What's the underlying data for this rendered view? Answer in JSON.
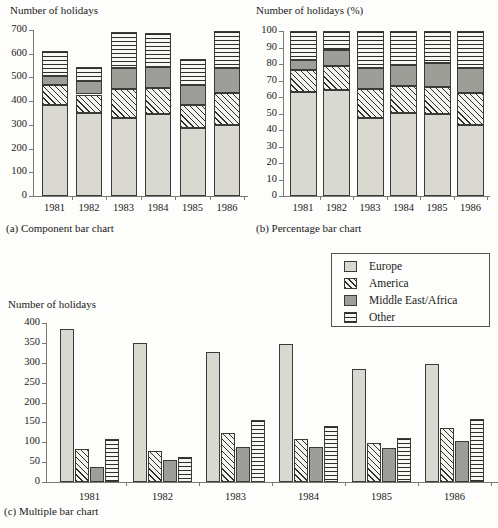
{
  "figure": {
    "panels": [
      {
        "caption": "(a) Component bar chart",
        "ylabel": "Number of holidays"
      },
      {
        "caption": "(b) Percentage bar chart",
        "ylabel": "Number of holidays (%)"
      },
      {
        "caption": "(c) Multiple bar chart",
        "ylabel": "Number of holidays"
      }
    ]
  },
  "legend": {
    "items": [
      {
        "label": "Europe",
        "swatch": "light-grey-solid-swatch",
        "color": "#d9d9d2"
      },
      {
        "label": "America",
        "swatch": "diagonal-hatch-swatch",
        "color": "#f4f4ef"
      },
      {
        "label": "Middle East/Africa",
        "swatch": "mid-grey-solid-swatch",
        "color": "#9e9e98"
      },
      {
        "label": "Other",
        "swatch": "horizontal-hatch-swatch",
        "color": "#f7f7f3"
      }
    ]
  },
  "chart_data": [
    {
      "type": "bar",
      "subtype": "stacked",
      "title": "(a) Component bar chart",
      "xlabel": "",
      "ylabel": "Number of holidays",
      "categories": [
        "1981",
        "1982",
        "1983",
        "1984",
        "1985",
        "1986"
      ],
      "yticks": [
        0,
        100,
        200,
        300,
        400,
        500,
        600,
        700
      ],
      "ylim": [
        0,
        700
      ],
      "grid": false,
      "series": [
        {
          "name": "Europe",
          "values": [
            385,
            350,
            327,
            347,
            285,
            298
          ]
        },
        {
          "name": "America",
          "values": [
            83,
            78,
            124,
            109,
            97,
            137
          ]
        },
        {
          "name": "Middle East/Africa",
          "values": [
            37,
            55,
            87,
            88,
            85,
            103
          ]
        },
        {
          "name": "Other",
          "values": [
            108,
            62,
            155,
            142,
            110,
            158
          ]
        }
      ],
      "totals": [
        613,
        545,
        693,
        686,
        577,
        696
      ]
    },
    {
      "type": "bar",
      "subtype": "percentage-stacked",
      "title": "(b) Percentage bar chart",
      "xlabel": "",
      "ylabel": "Number of holidays (%)",
      "categories": [
        "1981",
        "1982",
        "1983",
        "1984",
        "1985",
        "1986"
      ],
      "yticks": [
        0,
        10,
        20,
        30,
        40,
        50,
        60,
        70,
        80,
        90,
        100
      ],
      "ylim": [
        0,
        100
      ],
      "grid": false,
      "series": [
        {
          "name": "Europe",
          "values": [
            62.8,
            64.2,
            47.2,
            50.6,
            49.4,
            42.8
          ]
        },
        {
          "name": "America",
          "values": [
            13.5,
            14.3,
            17.9,
            15.9,
            16.8,
            19.7
          ]
        },
        {
          "name": "Middle East/Africa",
          "values": [
            6.0,
            10.1,
            12.6,
            12.8,
            14.7,
            14.8
          ]
        },
        {
          "name": "Other",
          "values": [
            17.7,
            11.4,
            22.3,
            20.7,
            19.1,
            22.7
          ]
        }
      ]
    },
    {
      "type": "bar",
      "subtype": "grouped",
      "title": "(c) Multiple bar chart",
      "xlabel": "",
      "ylabel": "Number of holidays",
      "categories": [
        "1981",
        "1982",
        "1983",
        "1984",
        "1985",
        "1986"
      ],
      "yticks": [
        0,
        50,
        100,
        150,
        200,
        250,
        300,
        350,
        400
      ],
      "ylim": [
        0,
        400
      ],
      "grid": false,
      "series": [
        {
          "name": "Europe",
          "values": [
            385,
            350,
            327,
            347,
            285,
            298
          ]
        },
        {
          "name": "America",
          "values": [
            83,
            78,
            124,
            109,
            97,
            137
          ]
        },
        {
          "name": "Middle East/Africa",
          "values": [
            37,
            55,
            87,
            88,
            85,
            103
          ]
        },
        {
          "name": "Other",
          "values": [
            108,
            62,
            155,
            142,
            110,
            158
          ]
        }
      ]
    }
  ]
}
